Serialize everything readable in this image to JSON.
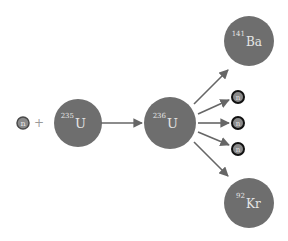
{
  "colors": {
    "nucleus_fill": "#6e6e6e",
    "neutron_fill": "#8a8a8a",
    "neutron_border_in": "#4a4a4a",
    "neutron_border_out": "#111111",
    "arrow": "#666666",
    "label": "#e6e6e6",
    "plus": "#9a9a9a"
  },
  "reactants": {
    "neutron": {
      "label": "n"
    },
    "plus": "+",
    "nucleus": {
      "mass": "235",
      "symbol": "U"
    }
  },
  "intermediate": {
    "mass": "236",
    "symbol": "U"
  },
  "products": {
    "barium": {
      "mass": "141",
      "symbol": "Ba"
    },
    "krypton": {
      "mass": "92",
      "symbol": "Kr"
    },
    "neutrons": [
      {
        "label": "n"
      },
      {
        "label": "n"
      },
      {
        "label": "n"
      }
    ]
  }
}
